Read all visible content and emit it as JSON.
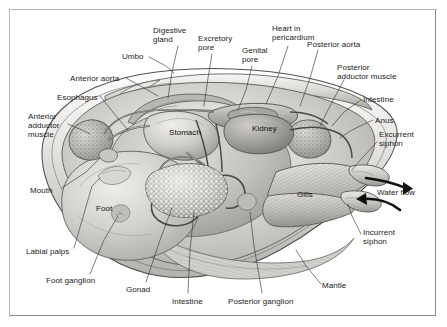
{
  "figure": {
    "border_color": "#8a8a8a",
    "background_color": "#ffffff",
    "ink_color": "#1a1a1a",
    "leader_color": "#3a3a3a"
  },
  "callouts": [
    {
      "id": "umbo",
      "label": "Umbo",
      "x": 122,
      "y": 52,
      "align": "left",
      "lines": [
        "Umbo"
      ]
    },
    {
      "id": "digestive-gland",
      "label": "Digestive gland",
      "x": 153,
      "y": 26,
      "align": "left",
      "lines": [
        "Digestive",
        "gland"
      ]
    },
    {
      "id": "excretory-pore",
      "label": "Excretory pore",
      "x": 198,
      "y": 34,
      "align": "left",
      "lines": [
        "Excretory",
        "pore"
      ]
    },
    {
      "id": "genital-pore",
      "label": "Genital pore",
      "x": 242,
      "y": 46,
      "align": "left",
      "lines": [
        "Genital",
        "pore"
      ]
    },
    {
      "id": "heart-in-pericardium",
      "label": "Heart in pericardium",
      "x": 272,
      "y": 24,
      "align": "left",
      "lines": [
        "Heart in",
        "pericardium"
      ]
    },
    {
      "id": "posterior-aorta",
      "label": "Posterior aorta",
      "x": 307,
      "y": 40,
      "align": "left",
      "lines": [
        "Posterior aorta"
      ]
    },
    {
      "id": "posterior-adductor-muscle",
      "label": "Posterior adductor muscle",
      "x": 337,
      "y": 63,
      "align": "left",
      "lines": [
        "Posterior",
        "adductor muscle"
      ]
    },
    {
      "id": "intestine-upper",
      "label": "Intestine",
      "x": 363,
      "y": 95,
      "align": "left",
      "lines": [
        "Intestine"
      ]
    },
    {
      "id": "anus",
      "label": "Anus",
      "x": 375,
      "y": 116,
      "align": "left",
      "lines": [
        "Anus"
      ]
    },
    {
      "id": "excurrent-siphon",
      "label": "Excurrent siphon",
      "x": 379,
      "y": 130,
      "align": "left",
      "lines": [
        "Excurrent",
        "siphon"
      ]
    },
    {
      "id": "water-flow",
      "label": "Water flow",
      "x": 377,
      "y": 188,
      "align": "left",
      "lines": [
        "Water flow"
      ]
    },
    {
      "id": "incurrent-siphon",
      "label": "Incurrent siphon",
      "x": 363,
      "y": 228,
      "align": "left",
      "lines": [
        "Incurrent",
        "siphon"
      ]
    },
    {
      "id": "mantle",
      "label": "Mantle",
      "x": 322,
      "y": 281,
      "align": "left",
      "lines": [
        "Mantle"
      ]
    },
    {
      "id": "posterior-ganglion",
      "label": "Posterior ganglion",
      "x": 228,
      "y": 297,
      "align": "left",
      "lines": [
        "Posterior ganglion"
      ]
    },
    {
      "id": "intestine-lower",
      "label": "Intestine",
      "x": 172,
      "y": 297,
      "align": "left",
      "lines": [
        "Intestine"
      ]
    },
    {
      "id": "gonad",
      "label": "Gonad",
      "x": 126,
      "y": 285,
      "align": "left",
      "lines": [
        "Gonad"
      ]
    },
    {
      "id": "foot-ganglion",
      "label": "Foot ganglion",
      "x": 46,
      "y": 276,
      "align": "left",
      "lines": [
        "Foot ganglion"
      ]
    },
    {
      "id": "labial-palps",
      "label": "Labial palps",
      "x": 26,
      "y": 247,
      "align": "left",
      "lines": [
        "Labial palps"
      ]
    },
    {
      "id": "mouth",
      "label": "Mouth",
      "x": 30,
      "y": 186,
      "align": "left",
      "lines": [
        "Mouth"
      ]
    },
    {
      "id": "anterior-adductor-muscle",
      "label": "Anterior adductor muscle",
      "x": 28,
      "y": 112,
      "align": "left",
      "lines": [
        "Anterior",
        "adductor",
        "muscle"
      ]
    },
    {
      "id": "esophagus",
      "label": "Esophagus",
      "x": 57,
      "y": 93,
      "align": "left",
      "lines": [
        "Esophagus"
      ]
    },
    {
      "id": "anterior-aorta",
      "label": "Anterior aorta",
      "x": 70,
      "y": 74,
      "align": "left",
      "lines": [
        "Anterior aorta"
      ]
    }
  ],
  "inner_labels": [
    {
      "id": "stomach",
      "label": "Stomach",
      "x": 169,
      "y": 128
    },
    {
      "id": "kidney",
      "label": "Kidney",
      "x": 252,
      "y": 124
    },
    {
      "id": "gills",
      "label": "Gills",
      "x": 297,
      "y": 190
    },
    {
      "id": "foot",
      "label": "Foot",
      "x": 96,
      "y": 204
    }
  ]
}
